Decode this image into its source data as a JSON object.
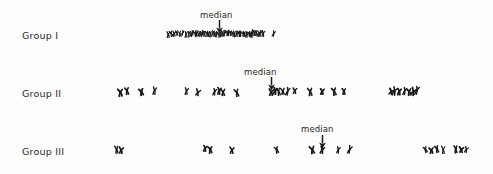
{
  "figure": {
    "type": "scatter",
    "width": 493,
    "height": 174,
    "background_color": "#fdfdfd",
    "ink_color": "#1a1a1a"
  },
  "labels": {
    "group1": "Group I",
    "group2": "Group II",
    "group3": "Group III",
    "median": "median"
  },
  "rows": [
    {
      "name": "group-1",
      "label": "Group I",
      "label_x": 22,
      "label_y": 30,
      "baseline_y": 34,
      "median_label_x": 200,
      "median_label_y": 10,
      "median_arrow_x": 215,
      "median_arrow_y": 20,
      "median_value": 219
    },
    {
      "name": "group-2",
      "label": "Group II",
      "label_x": 22,
      "label_y": 88,
      "baseline_y": 92,
      "median_label_x": 244,
      "median_label_y": 67,
      "median_arrow_x": 267,
      "median_arrow_y": 77,
      "median_value": 271
    },
    {
      "name": "group-3",
      "label": "Group III",
      "label_x": 22,
      "label_y": 146,
      "baseline_y": 150,
      "median_label_x": 301,
      "median_label_y": 124,
      "median_arrow_x": 318,
      "median_arrow_y": 135,
      "median_value": 322
    }
  ],
  "chart_data": {
    "type": "scatter",
    "title": "",
    "xlabel": "",
    "ylabel": "",
    "categories": [
      "Group I",
      "Group II",
      "Group III"
    ],
    "legend": [],
    "grid": false,
    "annotations": [
      "median",
      "median",
      "median"
    ],
    "medians": [
      219,
      271,
      322
    ],
    "series": [
      {
        "name": "Group I",
        "count": 46,
        "x": [
          168,
          171,
          174,
          177,
          180,
          183,
          186,
          189,
          191,
          193,
          195,
          197,
          199,
          201,
          203,
          205,
          207,
          209,
          211,
          213,
          215,
          217,
          219,
          221,
          223,
          225,
          227,
          229,
          231,
          233,
          235,
          237,
          239,
          241,
          243,
          245,
          247,
          249,
          251,
          253,
          255,
          257,
          259,
          261,
          263,
          274
        ]
      },
      {
        "name": "Group II",
        "count": 27,
        "x": [
          120,
          127,
          141,
          155,
          186,
          198,
          215,
          219,
          223,
          237,
          271,
          275,
          279,
          283,
          288,
          295,
          310,
          322,
          334,
          344,
          391,
          395,
          399,
          405,
          409,
          413,
          417
        ]
      },
      {
        "name": "Group III",
        "count": 17,
        "x": [
          117,
          121,
          205,
          210,
          232,
          277,
          312,
          322,
          338,
          350,
          426,
          431,
          437,
          443,
          456,
          461,
          466
        ]
      }
    ]
  }
}
